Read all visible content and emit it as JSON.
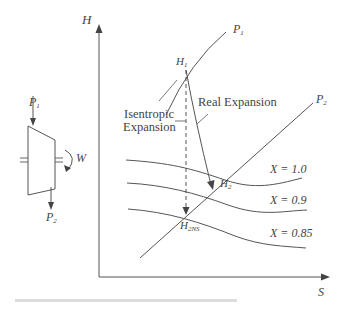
{
  "diagram": {
    "axes": {
      "y_label": "H",
      "x_label": "S"
    },
    "turbine": {
      "inlet_label": "P",
      "inlet_sub": "1",
      "outlet_label": "P",
      "outlet_sub": "2",
      "work_label": "W"
    },
    "isobars": [
      {
        "label": "P",
        "sub": "1"
      },
      {
        "label": "P",
        "sub": "2"
      }
    ],
    "points": {
      "h1": {
        "label": "H",
        "sub": "1"
      },
      "h2": {
        "label": "H",
        "sub": "2"
      },
      "h2ns": {
        "label": "H",
        "sub": "2NS"
      }
    },
    "annotations": {
      "isentropic_line1": "Isentropic",
      "isentropic_line2": "Expansion",
      "real": "Real Expansion"
    },
    "quality_lines": [
      {
        "label": "X = 1.0"
      },
      {
        "label": "X = 0.9"
      },
      {
        "label": "X = 0.85"
      }
    ],
    "colors": {
      "line": "#555555",
      "text": "#444444",
      "footer_bar": "#dcdcdc"
    }
  }
}
